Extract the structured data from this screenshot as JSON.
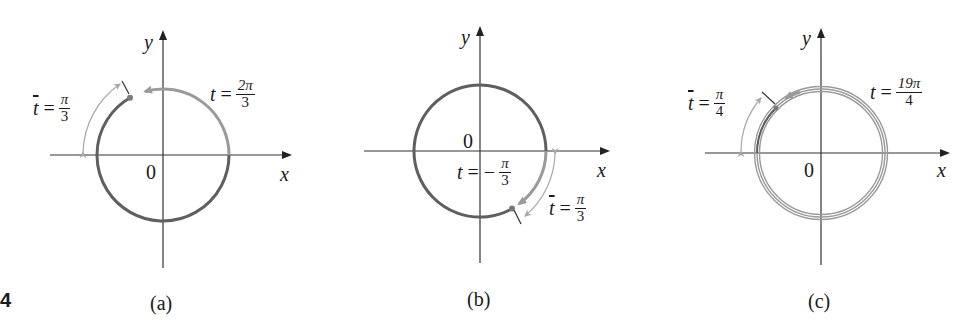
{
  "figure": {
    "number": "4",
    "colors": {
      "axis": "#333333",
      "circle_dark": "#5f5f5f",
      "circle_light": "#9a9a9a",
      "arrow_light": "#a8a8a8"
    },
    "panels": [
      {
        "id": "a",
        "caption": "(a)",
        "x_label": "x",
        "y_label": "y",
        "origin_label": "0",
        "t_label": {
          "var": "t",
          "eq": "=",
          "num": "2π",
          "den": "3"
        },
        "tbar_label": {
          "var": "t",
          "eq": "=",
          "num": "π",
          "den": "3"
        }
      },
      {
        "id": "b",
        "caption": "(b)",
        "x_label": "x",
        "y_label": "y",
        "origin_label": "0",
        "t_label": {
          "var": "t",
          "eq": "= −",
          "num": "π",
          "den": "3"
        },
        "tbar_label": {
          "var": "t",
          "eq": "=",
          "num": "π",
          "den": "3"
        }
      },
      {
        "id": "c",
        "caption": "(c)",
        "x_label": "x",
        "y_label": "y",
        "origin_label": "0",
        "t_label": {
          "var": "t",
          "eq": "=",
          "num": "19π",
          "den": "4"
        },
        "tbar_label": {
          "var": "t",
          "eq": "=",
          "num": "π",
          "den": "4"
        }
      }
    ]
  }
}
